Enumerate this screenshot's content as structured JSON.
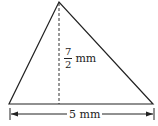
{
  "diagram": {
    "shape": "triangle",
    "height_label": {
      "numerator": "7",
      "denominator": "2",
      "unit": "mm"
    },
    "base_label": "5 mm",
    "colors": {
      "stroke": "#222222",
      "background": "#ffffff"
    }
  }
}
